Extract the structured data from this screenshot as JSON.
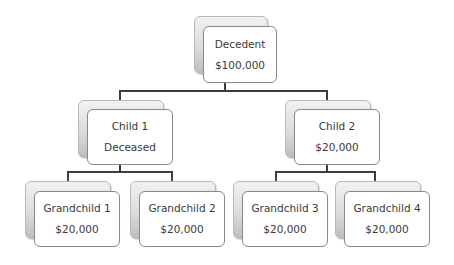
{
  "diagram": {
    "type": "family-tree",
    "colors": {
      "connector": "#3d3d3d",
      "box_border": "#8a8a8a",
      "back_box_fill": "#d9d9d9",
      "front_box_fill": "#ffffff",
      "text": "#3a3a3a"
    },
    "nodes": [
      {
        "id": "decedent",
        "label": "Decedent",
        "value": "$100,000",
        "level": 0
      },
      {
        "id": "child-1",
        "label": "Child 1",
        "value": "Deceased",
        "level": 1,
        "parent": "decedent"
      },
      {
        "id": "child-2",
        "label": "Child 2",
        "value": "$20,000",
        "level": 1,
        "parent": "decedent"
      },
      {
        "id": "grandchild-1",
        "label": "Grandchild 1",
        "value": "$20,000",
        "level": 2,
        "parent": "child-1"
      },
      {
        "id": "grandchild-2",
        "label": "Grandchild 2",
        "value": "$20,000",
        "level": 2,
        "parent": "child-1"
      },
      {
        "id": "grandchild-3",
        "label": "Grandchild 3",
        "value": "$20,000",
        "level": 2,
        "parent": "child-2"
      },
      {
        "id": "grandchild-4",
        "label": "Grandchild 4",
        "value": "$20,000",
        "level": 2,
        "parent": "child-2"
      }
    ]
  }
}
